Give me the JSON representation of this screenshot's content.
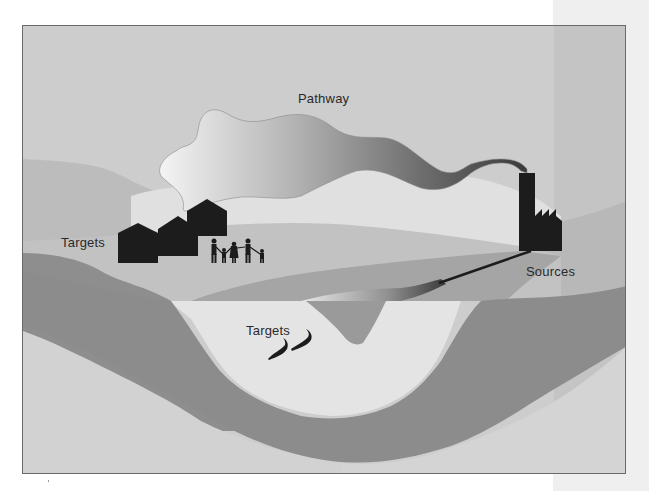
{
  "diagram": {
    "type": "pollution-source-pathway-target",
    "labels": {
      "pathway": "Pathway",
      "targets_land": "Targets",
      "targets_water": "Targets",
      "sources": "Sources"
    },
    "elements": {
      "source": "factory-icon",
      "pathway_air": "smoke-plume",
      "pathway_water": "discharge-pipe",
      "targets_land": [
        "house-icon",
        "house-icon",
        "house-icon",
        "family-icon"
      ],
      "targets_water": [
        "fish-icon",
        "fish-icon"
      ]
    },
    "colors": {
      "sky": "#cdcdcd",
      "far_hill": "#bdbdbd",
      "light_band": "#dedede",
      "mid_hill": "#b3b3b3",
      "dark_band": "#8e8e8e",
      "water": "#e4e4e4",
      "silhouette": "#1c1c1c",
      "side_panel": "#efefef",
      "frame_border": "#6a6a6a"
    }
  }
}
